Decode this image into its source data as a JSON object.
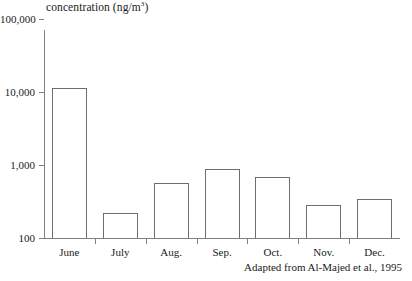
{
  "chart_data": {
    "type": "bar",
    "title": "",
    "ylabel": "concentration (ng/m3)",
    "ylabel_prefix": "concentration (ng/m",
    "ylabel_superscript": "3",
    "ylabel_suffix": ")",
    "xlabel": "",
    "categories": [
      "June",
      "July",
      "Aug.",
      "Sep.",
      "Oct.",
      "Nov.",
      "Dec."
    ],
    "values": [
      11500,
      220,
      570,
      870,
      690,
      280,
      340
    ],
    "yscale": "log",
    "ylim": [
      100,
      100000
    ],
    "ytick_labels": [
      "100,000",
      "10,000",
      "1,000",
      "100"
    ],
    "ytick_values": [
      100000,
      10000,
      1000,
      100
    ],
    "grid": false,
    "legend": "none",
    "annotation": "Adapted from Al-Majed et al., 1995",
    "bar_face_color": "#ffffff",
    "bar_edge_color": "#6e6e6e",
    "axis_color": "#808080",
    "text_color": "#1a1a1a"
  },
  "figure": {
    "source_note": "Adapted from Al-Majed et al., 1995"
  }
}
